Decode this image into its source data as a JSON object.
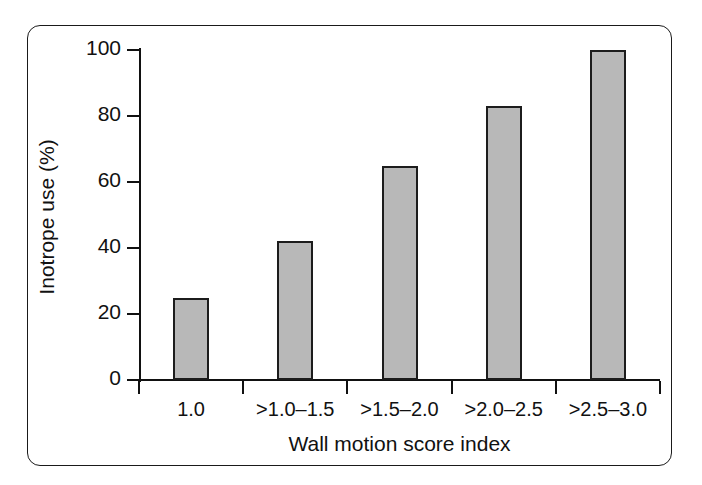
{
  "chart_data": {
    "type": "bar",
    "title": "",
    "subtitle": "",
    "xlabel": "Wall motion score index",
    "ylabel": "Inotrope use (%)",
    "categories": [
      "1.0",
      ">1.0–1.5",
      ">1.5–2.0",
      ">2.0–2.5",
      ">2.5–3.0"
    ],
    "values": [
      25,
      42,
      65,
      83,
      100
    ],
    "ylim": [
      0,
      100
    ],
    "yticks": [
      0,
      20,
      40,
      60,
      80,
      100
    ],
    "ytick_labels": [
      "0",
      "20",
      "40",
      "60",
      "80",
      "100"
    ],
    "grid": false,
    "legend": null,
    "bar_fill_color": "#b8b8b8",
    "bar_edge_color": "#1c1c1c",
    "axis_color": "#111111",
    "frame_color": "#1a1a1a",
    "background_color": "#ffffff"
  }
}
